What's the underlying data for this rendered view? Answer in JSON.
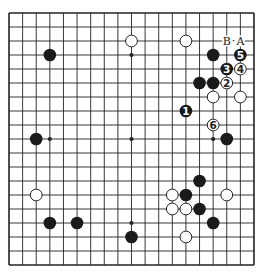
{
  "board": {
    "size": 19,
    "origin_x": 9,
    "origin_y": 13,
    "step_x": 13.61,
    "step_y": 14.0,
    "line_color": "#222222",
    "border_width": 1.6,
    "line_width": 0.9,
    "stone_radius": 6.3,
    "black_color": "#1a1a1a",
    "white_fill": "#ffffff",
    "white_stroke": "#222222"
  },
  "hoshi": [
    [
      3,
      3
    ],
    [
      9,
      3
    ],
    [
      15,
      3
    ],
    [
      3,
      9
    ],
    [
      9,
      9
    ],
    [
      15,
      9
    ],
    [
      3,
      15
    ],
    [
      9,
      15
    ],
    [
      15,
      15
    ]
  ],
  "stones": [
    {
      "color": "white",
      "col": 9,
      "row": 2
    },
    {
      "color": "white",
      "col": 13,
      "row": 2
    },
    {
      "color": "black",
      "col": 3,
      "row": 3
    },
    {
      "color": "black",
      "col": 15,
      "row": 3
    },
    {
      "color": "black",
      "col": 17,
      "row": 3,
      "label": "5"
    },
    {
      "color": "black",
      "col": 16,
      "row": 4,
      "label": "3"
    },
    {
      "color": "white",
      "col": 17,
      "row": 4,
      "label": "4"
    },
    {
      "color": "black",
      "col": 14,
      "row": 5
    },
    {
      "color": "black",
      "col": 15,
      "row": 5
    },
    {
      "color": "white",
      "col": 16,
      "row": 5,
      "label": "2"
    },
    {
      "color": "white",
      "col": 15,
      "row": 6
    },
    {
      "color": "white",
      "col": 17,
      "row": 6
    },
    {
      "color": "black",
      "col": 13,
      "row": 7,
      "label": "1"
    },
    {
      "color": "white",
      "col": 15,
      "row": 8,
      "label": "6"
    },
    {
      "color": "black",
      "col": 16,
      "row": 9
    },
    {
      "color": "black",
      "col": 2,
      "row": 9
    },
    {
      "color": "black",
      "col": 14,
      "row": 12
    },
    {
      "color": "white",
      "col": 12,
      "row": 13
    },
    {
      "color": "black",
      "col": 13,
      "row": 13
    },
    {
      "color": "white",
      "col": 16,
      "row": 13
    },
    {
      "color": "white",
      "col": 2,
      "row": 13
    },
    {
      "color": "white",
      "col": 12,
      "row": 14
    },
    {
      "color": "white",
      "col": 13,
      "row": 14
    },
    {
      "color": "black",
      "col": 14,
      "row": 14
    },
    {
      "color": "black",
      "col": 3,
      "row": 15
    },
    {
      "color": "black",
      "col": 5,
      "row": 15
    },
    {
      "color": "black",
      "col": 15,
      "row": 15
    },
    {
      "color": "black",
      "col": 9,
      "row": 16
    },
    {
      "color": "white",
      "col": 13,
      "row": 16
    }
  ],
  "point_labels": [
    {
      "text": "B",
      "col": 16,
      "row": 2
    },
    {
      "text": "·",
      "col": 16.5,
      "row": 2
    },
    {
      "text": "A",
      "col": 17,
      "row": 2
    }
  ]
}
